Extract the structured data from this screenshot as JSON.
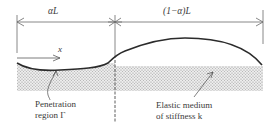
{
  "diagram": {
    "type": "beam-on-elastic-foundation",
    "dimensions": {
      "left_label": "αL",
      "right_label": "(1−α)L"
    },
    "axis": {
      "label": "x"
    },
    "annotations": {
      "penetration_line1": "Penetration",
      "penetration_line2": "region Γ",
      "medium_line1": "Elastic medium",
      "medium_line2": "of stiffness k"
    },
    "icons": {
      "dimension_arrow": "arrow-icon",
      "x_axis_arrow": "arrow-right-icon",
      "leader_arrow": "leader-arrow-icon"
    },
    "colors": {
      "line": "#2b2b2b",
      "guide": "#6a6a6a",
      "stipple": "#9a9a9a",
      "text": "#3a3a3a"
    }
  }
}
